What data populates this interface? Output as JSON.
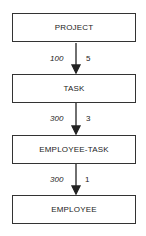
{
  "diagram": {
    "entities": [
      {
        "name": "PROJECT"
      },
      {
        "name": "TASK"
      },
      {
        "name": "EMPLOYEE-TASK"
      },
      {
        "name": "EMPLOYEE"
      }
    ],
    "relationships": [
      {
        "from": "PROJECT",
        "to": "TASK",
        "left_value": "100",
        "right_value": "5"
      },
      {
        "from": "TASK",
        "to": "EMPLOYEE-TASK",
        "left_value": "300",
        "right_value": "3"
      },
      {
        "from": "EMPLOYEE-TASK",
        "to": "EMPLOYEE",
        "left_value": "300",
        "right_value": "1"
      }
    ]
  }
}
